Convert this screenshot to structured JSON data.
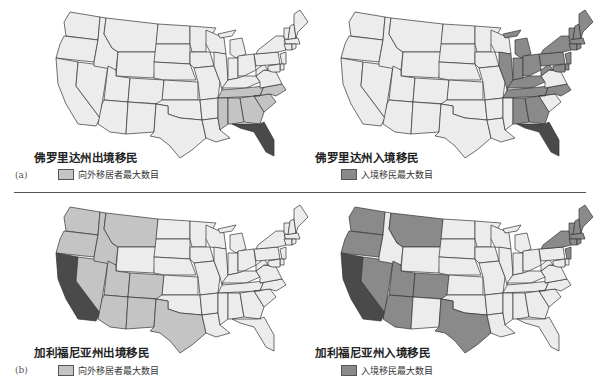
{
  "colors": {
    "default": "#ececec",
    "outflow_light": "#c4c4c4",
    "inflow_medium": "#8a8a8a",
    "origin_dark": "#4a4a4a"
  },
  "rows": [
    {
      "label": "(a)",
      "maps": [
        {
          "title": "佛罗里达州出境移民",
          "legend_label": "向外移居者最大数目",
          "legend_color": "#c4c4c4",
          "origin_state": "FL",
          "highlighted_states": [
            "MS",
            "AL",
            "GA",
            "SC",
            "NC",
            "TN"
          ]
        },
        {
          "title": "佛罗里达州入境移民",
          "legend_label": "入境移民最大数目",
          "legend_color": "#8a8a8a",
          "origin_state": "FL",
          "highlighted_states": [
            "IL",
            "IN",
            "OH",
            "MI",
            "KY",
            "TN",
            "WV",
            "PA",
            "NY",
            "NJ",
            "CT",
            "RI",
            "MA",
            "VT",
            "NH",
            "ME",
            "MD",
            "DE",
            "NC",
            "AL",
            "GA"
          ]
        }
      ]
    },
    {
      "label": "(b)",
      "maps": [
        {
          "title": "加利福尼亚州出境移民",
          "legend_label": "向外移居者最大数目",
          "legend_color": "#c4c4c4",
          "origin_state": "CA",
          "highlighted_states": [
            "WA",
            "OR",
            "ID",
            "MT",
            "NV",
            "UT",
            "CO",
            "AZ",
            "NM",
            "TX"
          ]
        },
        {
          "title": "加利福尼亚州入境移民",
          "legend_label": "入境移民最大数目",
          "legend_color": "#8a8a8a",
          "origin_state": "CA",
          "highlighted_states": [
            "WA",
            "OR",
            "MT",
            "NV",
            "UT",
            "CO",
            "AZ",
            "TX",
            "NY",
            "NJ",
            "CT",
            "RI",
            "MA",
            "VT",
            "NH",
            "ME"
          ]
        }
      ]
    }
  ]
}
